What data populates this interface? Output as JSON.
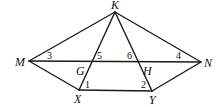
{
  "diagram": {
    "points": [
      {
        "id": "K",
        "label": "K",
        "x": 115,
        "y": 12,
        "lx": 111,
        "ly": 9
      },
      {
        "id": "M",
        "label": "M",
        "x": 29,
        "y": 61,
        "lx": 15,
        "ly": 66
      },
      {
        "id": "N",
        "label": "N",
        "x": 201,
        "y": 62,
        "lx": 204,
        "ly": 67
      },
      {
        "id": "X",
        "label": "X",
        "x": 79,
        "y": 90,
        "lx": 74,
        "ly": 103
      },
      {
        "id": "Y",
        "label": "Y",
        "x": 152,
        "y": 91,
        "lx": 149,
        "ly": 104
      },
      {
        "id": "G",
        "label": "G",
        "x": 92,
        "y": 62,
        "lx": 76,
        "ly": 75
      },
      {
        "id": "H",
        "label": "H",
        "x": 138,
        "y": 62,
        "lx": 143,
        "ly": 75
      }
    ],
    "segments": [
      [
        "K",
        "M"
      ],
      [
        "K",
        "N"
      ],
      [
        "M",
        "N"
      ],
      [
        "M",
        "X"
      ],
      [
        "N",
        "Y"
      ],
      [
        "X",
        "Y"
      ],
      [
        "K",
        "X"
      ],
      [
        "K",
        "Y"
      ]
    ],
    "angles": [
      {
        "label": "3",
        "x": 47,
        "y": 59
      },
      {
        "label": "5",
        "x": 97,
        "y": 59
      },
      {
        "label": "6",
        "x": 127,
        "y": 59
      },
      {
        "label": "4",
        "x": 176,
        "y": 59
      },
      {
        "label": "1",
        "x": 85,
        "y": 88
      },
      {
        "label": "2",
        "x": 141,
        "y": 88
      }
    ]
  }
}
